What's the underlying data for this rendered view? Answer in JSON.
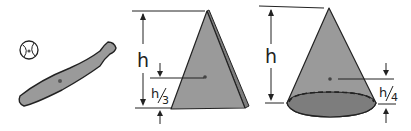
{
  "figures": [
    {
      "name": "baseball-bat",
      "label": ""
    },
    {
      "name": "triangle-plate",
      "height_label": "h",
      "centroid_label": "h/3",
      "centroid_num": "h",
      "centroid_den": "3"
    },
    {
      "name": "solid-cone",
      "height_label": "h",
      "centroid_label": "h/4",
      "centroid_num": "h",
      "centroid_den": "4"
    }
  ],
  "colors": {
    "fill": "#9a9a9a",
    "fill_dark": "#7d7d7d",
    "stroke": "#222222",
    "background": "#ffffff"
  }
}
